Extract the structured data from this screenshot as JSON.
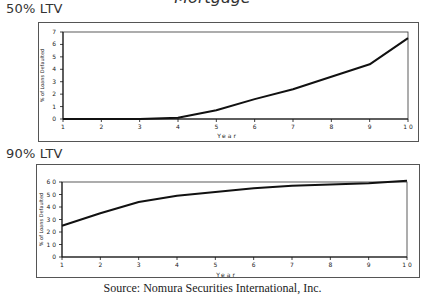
{
  "header": {
    "cut_title": "Mortgage"
  },
  "panels": [
    {
      "label": "50% LTV"
    },
    {
      "label": "90% LTV"
    }
  ],
  "source": "Source: Nomura Securities International, Inc.",
  "chart_data": [
    {
      "type": "line",
      "title": "50% LTV",
      "xlabel": "Year",
      "ylabel": "% of Loans Defaulted",
      "x": [
        1,
        2,
        3,
        4,
        5,
        6,
        7,
        8,
        9,
        10
      ],
      "series": [
        {
          "name": "50% LTV",
          "values": [
            0,
            0,
            0,
            0.1,
            0.7,
            1.6,
            2.4,
            3.4,
            4.4,
            6.5
          ]
        }
      ],
      "yticks": [
        0,
        1,
        2,
        3,
        4,
        5,
        6,
        7
      ],
      "xticks": [
        1,
        2,
        3,
        4,
        5,
        6,
        7,
        8,
        9,
        10
      ],
      "ylim": [
        0,
        7
      ],
      "grid": false,
      "legend": false
    },
    {
      "type": "line",
      "title": "90% LTV",
      "xlabel": "Year",
      "ylabel": "% of Loans Defaulted",
      "x": [
        1,
        2,
        3,
        4,
        5,
        6,
        7,
        8,
        9,
        10
      ],
      "series": [
        {
          "name": "90% LTV",
          "values": [
            25,
            35,
            44,
            49,
            52,
            55,
            57,
            58,
            59,
            61
          ]
        }
      ],
      "yticks": [
        0,
        10,
        20,
        30,
        40,
        50,
        60
      ],
      "xticks": [
        1,
        2,
        3,
        4,
        5,
        6,
        7,
        8,
        9,
        10
      ],
      "ylim": [
        0,
        60
      ],
      "grid": false,
      "legend": false
    }
  ]
}
